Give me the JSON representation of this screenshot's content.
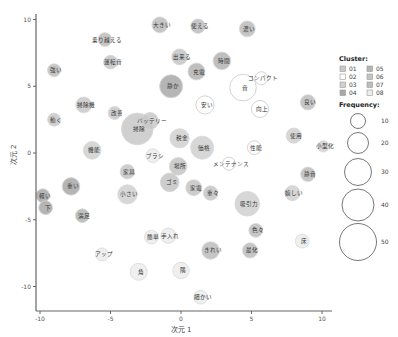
{
  "chart_data": {
    "type": "scatter",
    "subtype": "bubble",
    "title": "",
    "xlabel": "次元 1",
    "ylabel": "次元 2",
    "xlim": [
      -10.5,
      10.5
    ],
    "ylim": [
      -11.5,
      10.8
    ],
    "xticks": [
      -10,
      -5,
      0,
      5,
      10
    ],
    "yticks": [
      -10,
      -5,
      0,
      5,
      10
    ],
    "grid": false,
    "legend_position": "right",
    "cluster_legend": {
      "title": "Cluster:",
      "items": [
        {
          "label": "01",
          "color": "#c8c8c8"
        },
        {
          "label": "02",
          "color": "#ffffff"
        },
        {
          "label": "03",
          "color": "#d0d0d0"
        },
        {
          "label": "04",
          "color": "#a8a8a8"
        },
        {
          "label": "05",
          "color": "#b4b4b4"
        },
        {
          "label": "06",
          "color": "#c4c4c4"
        },
        {
          "label": "07",
          "color": "#bcbcbc"
        },
        {
          "label": "08",
          "color": "#ececec"
        }
      ]
    },
    "size_legend": {
      "title": "Frequency:",
      "items": [
        {
          "label": "10",
          "value": 10
        },
        {
          "label": "20",
          "value": 20
        },
        {
          "label": "30",
          "value": 30
        },
        {
          "label": "40",
          "value": 40
        },
        {
          "label": "50",
          "value": 50
        }
      ]
    },
    "points": [
      {
        "label": "大きい",
        "x": -1.5,
        "y": 9.6,
        "freq": 12,
        "cluster": "07"
      },
      {
        "label": "使える",
        "x": 1.2,
        "y": 9.5,
        "freq": 10,
        "cluster": "07"
      },
      {
        "label": "濃い",
        "x": 4.7,
        "y": 9.3,
        "freq": 12,
        "cluster": "07"
      },
      {
        "label": "乗り越える",
        "x": -5.4,
        "y": 8.5,
        "freq": 9,
        "cluster": "07"
      },
      {
        "label": "運転音",
        "x": -5.0,
        "y": 6.8,
        "freq": 9,
        "cluster": "06"
      },
      {
        "label": "出来る",
        "x": -0.1,
        "y": 7.2,
        "freq": 12,
        "cluster": "06"
      },
      {
        "label": "充電",
        "x": 1.1,
        "y": 6.1,
        "freq": 14,
        "cluster": "05"
      },
      {
        "label": "時間",
        "x": 2.9,
        "y": 6.9,
        "freq": 15,
        "cluster": "05"
      },
      {
        "label": "強い",
        "x": -9.0,
        "y": 6.2,
        "freq": 8,
        "cluster": "07"
      },
      {
        "label": "コンパクト",
        "x": 5.7,
        "y": 5.6,
        "freq": 8,
        "cluster": "02"
      },
      {
        "label": "音",
        "x": 4.4,
        "y": 4.9,
        "freq": 35,
        "cluster": "02"
      },
      {
        "label": "静か",
        "x": -0.7,
        "y": 5.0,
        "freq": 26,
        "cluster": "04"
      },
      {
        "label": "良い",
        "x": 9.0,
        "y": 3.8,
        "freq": 11,
        "cluster": "07"
      },
      {
        "label": "安い",
        "x": 1.7,
        "y": 3.6,
        "freq": 16,
        "cluster": "02"
      },
      {
        "label": "向上",
        "x": 5.6,
        "y": 3.3,
        "freq": 14,
        "cluster": "02"
      },
      {
        "label": "掃除機",
        "x": -6.9,
        "y": 3.6,
        "freq": 12,
        "cluster": "01"
      },
      {
        "label": "改善",
        "x": -4.7,
        "y": 3.0,
        "freq": 8,
        "cluster": "01"
      },
      {
        "label": "動く",
        "x": -9.0,
        "y": 2.5,
        "freq": 8,
        "cluster": "01"
      },
      {
        "label": "バッテリー",
        "x": -2.2,
        "y": 2.4,
        "freq": 14,
        "cluster": "01"
      },
      {
        "label": "掃除",
        "x": -3.1,
        "y": 1.8,
        "freq": 50,
        "cluster": "01"
      },
      {
        "label": "使用",
        "x": 8.0,
        "y": 1.3,
        "freq": 11,
        "cluster": "03"
      },
      {
        "label": "小型化",
        "x": 10.1,
        "y": 0.5,
        "freq": 6,
        "cluster": "03"
      },
      {
        "label": "税金",
        "x": -0.1,
        "y": 1.1,
        "freq": 18,
        "cluster": "03"
      },
      {
        "label": "価格",
        "x": 1.5,
        "y": 0.4,
        "freq": 26,
        "cluster": "03"
      },
      {
        "label": "性能",
        "x": 5.2,
        "y": 0.4,
        "freq": 9,
        "cluster": "02"
      },
      {
        "label": "機能",
        "x": -6.3,
        "y": 0.2,
        "freq": 15,
        "cluster": "03"
      },
      {
        "label": "ブラシ",
        "x": -2.0,
        "y": -0.2,
        "freq": 9,
        "cluster": "08"
      },
      {
        "label": "場所",
        "x": -0.2,
        "y": -1.0,
        "freq": 15,
        "cluster": "06"
      },
      {
        "label": "メンテナンス",
        "x": 3.4,
        "y": -0.8,
        "freq": 8,
        "cluster": "02"
      },
      {
        "label": "静音",
        "x": 9.0,
        "y": -1.6,
        "freq": 10,
        "cluster": "07"
      },
      {
        "label": "家具",
        "x": -3.8,
        "y": -1.4,
        "freq": 10,
        "cluster": "06"
      },
      {
        "label": "ゴミ",
        "x": -0.8,
        "y": -2.2,
        "freq": 17,
        "cluster": "06"
      },
      {
        "label": "家電",
        "x": 0.9,
        "y": -2.6,
        "freq": 12,
        "cluster": "06"
      },
      {
        "label": "重々",
        "x": 2.1,
        "y": -3.0,
        "freq": 10,
        "cluster": "06"
      },
      {
        "label": "吸引力",
        "x": 4.7,
        "y": -3.8,
        "freq": 30,
        "cluster": "03"
      },
      {
        "label": "嬉しい",
        "x": 7.9,
        "y": -3.0,
        "freq": 11,
        "cluster": "03"
      },
      {
        "label": "重い",
        "x": -7.8,
        "y": -2.5,
        "freq": 15,
        "cluster": "04"
      },
      {
        "label": "小さい",
        "x": -3.8,
        "y": -3.1,
        "freq": 18,
        "cluster": "03"
      },
      {
        "label": "軽い",
        "x": -9.8,
        "y": -3.2,
        "freq": 9,
        "cluster": "04"
      },
      {
        "label": "下",
        "x": -9.6,
        "y": -4.1,
        "freq": 9,
        "cluster": "04"
      },
      {
        "label": "満足",
        "x": -7.0,
        "y": -4.7,
        "freq": 9,
        "cluster": "05"
      },
      {
        "label": "色々",
        "x": 5.3,
        "y": -5.8,
        "freq": 9,
        "cluster": "07"
      },
      {
        "label": "床",
        "x": 8.6,
        "y": -6.6,
        "freq": 9,
        "cluster": "08"
      },
      {
        "label": "手入れ",
        "x": -0.9,
        "y": -6.2,
        "freq": 11,
        "cluster": "08"
      },
      {
        "label": "簡単",
        "x": -2.1,
        "y": -6.3,
        "freq": 9,
        "cluster": "08"
      },
      {
        "label": "きれい",
        "x": 2.1,
        "y": -7.3,
        "freq": 15,
        "cluster": "07"
      },
      {
        "label": "最化",
        "x": 4.9,
        "y": -7.3,
        "freq": 11,
        "cluster": "07"
      },
      {
        "label": "アップ",
        "x": -5.6,
        "y": -7.6,
        "freq": 8,
        "cluster": "08"
      },
      {
        "label": "角",
        "x": -3.0,
        "y": -8.9,
        "freq": 14,
        "cluster": "08"
      },
      {
        "label": "隅",
        "x": 0.0,
        "y": -8.8,
        "freq": 13,
        "cluster": "08"
      },
      {
        "label": "細かい",
        "x": 1.4,
        "y": -10.8,
        "freq": 9,
        "cluster": "08"
      }
    ]
  }
}
